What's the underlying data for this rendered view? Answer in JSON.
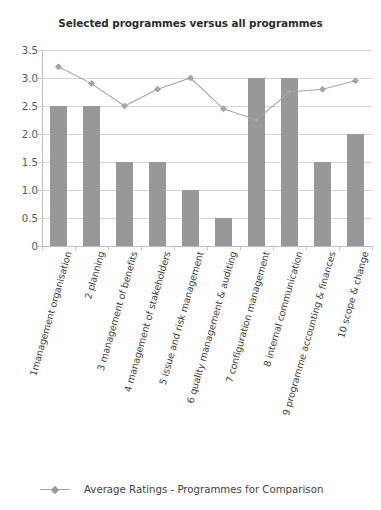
{
  "chart_data": {
    "type": "bar",
    "title": "Selected programmes versus all programmes",
    "xlabel": "",
    "ylabel": "",
    "ylim": [
      0,
      3.5
    ],
    "ytick_labels": [
      "3.5",
      "3.0",
      "2.5",
      "2.0",
      "1.5",
      "1.0",
      "0.5",
      "0"
    ],
    "ytick_values": [
      3.5,
      3.0,
      2.5,
      2.0,
      1.5,
      1.0,
      0.5,
      0
    ],
    "grid": true,
    "legend_position": "bottom-left",
    "categories": [
      "1management organisation",
      "2 planning",
      "3 management of benefits",
      "4 management of stakeholders",
      "5 issue and risk management",
      "6 quality management & auditing",
      "7 configuration management",
      "8 internal communication",
      "9 programme accounting & finances",
      "10 scope & change"
    ],
    "series": [
      {
        "name": "Selected programme ratings",
        "type": "bar",
        "color": "#989898",
        "values": [
          2.5,
          2.5,
          1.5,
          1.5,
          1.0,
          0.5,
          3.0,
          3.0,
          1.5,
          2.0
        ]
      },
      {
        "name": "Average Ratings - Programmes for Comparison",
        "type": "line",
        "color": "#a6a6a6",
        "marker": "diamond",
        "values": [
          3.2,
          2.9,
          2.5,
          2.8,
          3.0,
          2.45,
          2.25,
          2.75,
          2.8,
          2.95
        ]
      }
    ],
    "legend": [
      "Average Ratings - Programmes for Comparison"
    ]
  },
  "legend": {
    "entry_label": "Average Ratings - Programmes for Comparison",
    "symbol_name": "line-diamond-marker"
  },
  "colors": {
    "bar": "#989898",
    "line": "#a6a6a6",
    "marker": "#9a9a9a",
    "gridline": "#d6d6d6",
    "axis": "#bdbdbd",
    "title_text": "#2b2b2b",
    "tick_text": "#565656",
    "background": "#ffffff"
  }
}
